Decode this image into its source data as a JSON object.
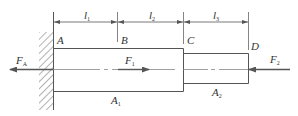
{
  "diagram": {
    "type": "stepped-bar-axial-load",
    "colors": {
      "line": "#555555",
      "text": "#333333",
      "background": "#ffffff"
    },
    "points": [
      {
        "id": "A",
        "label": "A"
      },
      {
        "id": "B",
        "label": "B"
      },
      {
        "id": "C",
        "label": "C"
      },
      {
        "id": "D",
        "label": "D"
      }
    ],
    "dimensions": [
      {
        "label": "l",
        "sub": "1",
        "from": "A",
        "to": "B"
      },
      {
        "label": "l",
        "sub": "2",
        "from": "B",
        "to": "C"
      },
      {
        "label": "l",
        "sub": "3",
        "from": "C",
        "to": "D"
      }
    ],
    "sections": [
      {
        "label": "A",
        "sub": "1",
        "from": "A",
        "to": "C"
      },
      {
        "label": "A",
        "sub": "2",
        "from": "C",
        "to": "D"
      }
    ],
    "forces": [
      {
        "label": "F",
        "sub": "A",
        "at": "A",
        "direction": "left"
      },
      {
        "label": "F",
        "sub": "1",
        "at": "B",
        "direction": "right"
      },
      {
        "label": "F",
        "sub": "2",
        "at": "D",
        "direction": "left"
      }
    ],
    "support": {
      "type": "fixed-wall",
      "at": "A"
    }
  }
}
